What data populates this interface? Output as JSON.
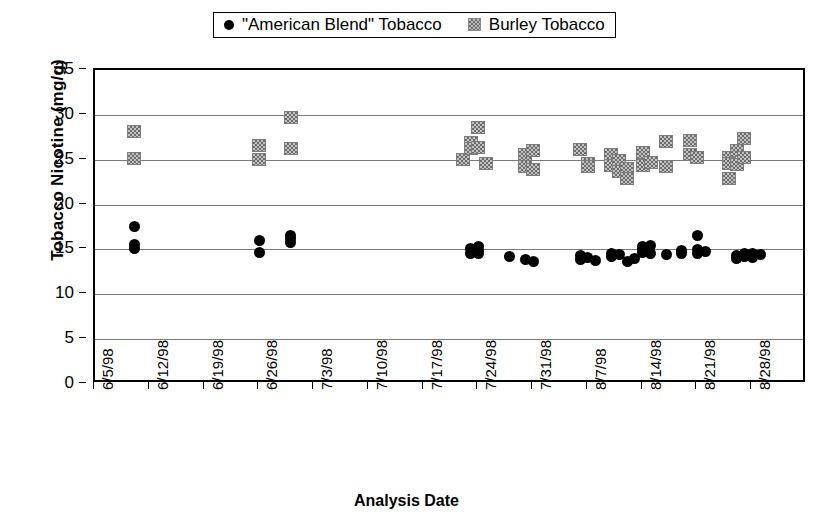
{
  "chart_data": {
    "type": "scatter",
    "title": "",
    "xlabel": "Analysis Date",
    "ylabel": "Tobacco Nicotine (mg/g)",
    "ylim": [
      0,
      35
    ],
    "yticks": [
      0,
      5,
      10,
      15,
      20,
      25,
      30,
      35
    ],
    "grid": true,
    "legend_position": "top-center",
    "xtick_labels": [
      "6/5/98",
      "6/12/98",
      "6/19/98",
      "6/26/98",
      "7/3/98",
      "7/10/98",
      "7/17/98",
      "7/24/98",
      "7/31/98",
      "8/7/98",
      "8/14/98",
      "8/21/98",
      "8/28/98"
    ],
    "xlim_dates": [
      "6/5/98",
      "9/4/98"
    ],
    "series": [
      {
        "name": "\"American Blend\" Tobacco",
        "marker": "circle",
        "color": "#000000",
        "points": [
          {
            "date": "6/10/98",
            "value": 17.6
          },
          {
            "date": "6/10/98",
            "value": 15.5
          },
          {
            "date": "6/10/98",
            "value": 15.1
          },
          {
            "date": "6/26/98",
            "value": 16.0
          },
          {
            "date": "6/26/98",
            "value": 14.7
          },
          {
            "date": "6/30/98",
            "value": 16.6
          },
          {
            "date": "6/30/98",
            "value": 16.2
          },
          {
            "date": "6/30/98",
            "value": 15.8
          },
          {
            "date": "7/23/98",
            "value": 15.1
          },
          {
            "date": "7/23/98",
            "value": 14.6
          },
          {
            "date": "7/24/98",
            "value": 15.3
          },
          {
            "date": "7/24/98",
            "value": 14.9
          },
          {
            "date": "7/24/98",
            "value": 14.5
          },
          {
            "date": "7/28/98",
            "value": 14.2
          },
          {
            "date": "7/30/98",
            "value": 13.9
          },
          {
            "date": "7/31/98",
            "value": 13.6
          },
          {
            "date": "8/6/98",
            "value": 14.3
          },
          {
            "date": "8/6/98",
            "value": 13.9
          },
          {
            "date": "8/7/98",
            "value": 14.1
          },
          {
            "date": "8/8/98",
            "value": 13.8
          },
          {
            "date": "8/10/98",
            "value": 14.5
          },
          {
            "date": "8/10/98",
            "value": 14.2
          },
          {
            "date": "8/11/98",
            "value": 14.4
          },
          {
            "date": "8/12/98",
            "value": 13.7
          },
          {
            "date": "8/13/98",
            "value": 14.0
          },
          {
            "date": "8/14/98",
            "value": 15.3
          },
          {
            "date": "8/14/98",
            "value": 15.1
          },
          {
            "date": "8/14/98",
            "value": 14.7
          },
          {
            "date": "8/15/98",
            "value": 15.4
          },
          {
            "date": "8/15/98",
            "value": 14.6
          },
          {
            "date": "8/17/98",
            "value": 14.4
          },
          {
            "date": "8/19/98",
            "value": 14.9
          },
          {
            "date": "8/19/98",
            "value": 14.6
          },
          {
            "date": "8/21/98",
            "value": 16.6
          },
          {
            "date": "8/21/98",
            "value": 15.0
          },
          {
            "date": "8/21/98",
            "value": 14.5
          },
          {
            "date": "8/22/98",
            "value": 14.8
          },
          {
            "date": "8/26/98",
            "value": 14.3
          },
          {
            "date": "8/26/98",
            "value": 14.0
          },
          {
            "date": "8/27/98",
            "value": 14.6
          },
          {
            "date": "8/27/98",
            "value": 14.2
          },
          {
            "date": "8/28/98",
            "value": 14.5
          },
          {
            "date": "8/28/98",
            "value": 14.1
          },
          {
            "date": "8/29/98",
            "value": 14.4
          }
        ]
      },
      {
        "name": "Burley Tobacco",
        "marker": "square",
        "color": "#b0b0b0",
        "points": [
          {
            "date": "6/10/98",
            "value": 28.1
          },
          {
            "date": "6/10/98",
            "value": 25.1
          },
          {
            "date": "6/26/98",
            "value": 26.6
          },
          {
            "date": "6/26/98",
            "value": 25.0
          },
          {
            "date": "6/30/98",
            "value": 29.7
          },
          {
            "date": "6/30/98",
            "value": 26.3
          },
          {
            "date": "7/22/98",
            "value": 25.0
          },
          {
            "date": "7/23/98",
            "value": 26.9
          },
          {
            "date": "7/23/98",
            "value": 26.3
          },
          {
            "date": "7/24/98",
            "value": 28.6
          },
          {
            "date": "7/24/98",
            "value": 26.4
          },
          {
            "date": "7/25/98",
            "value": 24.6
          },
          {
            "date": "7/30/98",
            "value": 25.6
          },
          {
            "date": "7/30/98",
            "value": 24.2
          },
          {
            "date": "7/31/98",
            "value": 26.0
          },
          {
            "date": "7/31/98",
            "value": 23.9
          },
          {
            "date": "8/6/98",
            "value": 26.1
          },
          {
            "date": "8/7/98",
            "value": 24.6
          },
          {
            "date": "8/7/98",
            "value": 24.2
          },
          {
            "date": "8/10/98",
            "value": 25.6
          },
          {
            "date": "8/10/98",
            "value": 24.4
          },
          {
            "date": "8/11/98",
            "value": 24.9
          },
          {
            "date": "8/11/98",
            "value": 23.7
          },
          {
            "date": "8/12/98",
            "value": 24.0
          },
          {
            "date": "8/12/98",
            "value": 22.9
          },
          {
            "date": "8/14/98",
            "value": 25.8
          },
          {
            "date": "8/14/98",
            "value": 24.4
          },
          {
            "date": "8/15/98",
            "value": 24.7
          },
          {
            "date": "8/17/98",
            "value": 27.0
          },
          {
            "date": "8/17/98",
            "value": 24.2
          },
          {
            "date": "8/20/98",
            "value": 27.1
          },
          {
            "date": "8/20/98",
            "value": 25.6
          },
          {
            "date": "8/21/98",
            "value": 25.2
          },
          {
            "date": "8/25/98",
            "value": 25.3
          },
          {
            "date": "8/25/98",
            "value": 24.6
          },
          {
            "date": "8/25/98",
            "value": 22.9
          },
          {
            "date": "8/26/98",
            "value": 26.0
          },
          {
            "date": "8/26/98",
            "value": 24.5
          },
          {
            "date": "8/27/98",
            "value": 27.4
          },
          {
            "date": "8/27/98",
            "value": 25.3
          }
        ]
      }
    ]
  },
  "legend": {
    "entries": [
      {
        "label": "\"American Blend\" Tobacco",
        "marker": "circle-marker-icon"
      },
      {
        "label": "Burley Tobacco",
        "marker": "square-marker-icon"
      }
    ]
  }
}
